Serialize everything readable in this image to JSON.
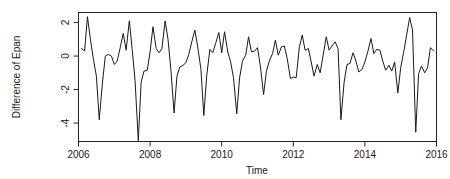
{
  "chart_data": {
    "type": "line",
    "title": "",
    "xlabel": "Time",
    "ylabel": "Difference of Epan",
    "xlim": [
      2006.0,
      2016.0
    ],
    "ylim": [
      -5.1,
      2.6
    ],
    "xticks": [
      2006,
      2008,
      2010,
      2012,
      2014,
      2016
    ],
    "xtick_labels": [
      "2006",
      "2008",
      "2010",
      "2012",
      "2014",
      "2016"
    ],
    "yticks": [
      2,
      0,
      -2,
      -4
    ],
    "ytick_labels": [
      "2",
      "0",
      "-2",
      "-4"
    ],
    "grid": false,
    "legend": null,
    "line_color": "#1a1a1a",
    "series": [
      {
        "name": "Difference of Epan",
        "x": [
          2006.08,
          2006.17,
          2006.25,
          2006.33,
          2006.42,
          2006.5,
          2006.58,
          2006.67,
          2006.75,
          2006.83,
          2006.92,
          2007.0,
          2007.08,
          2007.17,
          2007.25,
          2007.33,
          2007.42,
          2007.5,
          2007.58,
          2007.67,
          2007.75,
          2007.83,
          2007.92,
          2008.0,
          2008.08,
          2008.17,
          2008.25,
          2008.33,
          2008.42,
          2008.5,
          2008.58,
          2008.67,
          2008.75,
          2008.83,
          2008.92,
          2009.0,
          2009.08,
          2009.17,
          2009.25,
          2009.33,
          2009.42,
          2009.5,
          2009.58,
          2009.67,
          2009.75,
          2009.83,
          2009.92,
          2010.0,
          2010.08,
          2010.17,
          2010.25,
          2010.33,
          2010.42,
          2010.5,
          2010.58,
          2010.67,
          2010.75,
          2010.83,
          2010.92,
          2011.0,
          2011.08,
          2011.17,
          2011.25,
          2011.33,
          2011.42,
          2011.5,
          2011.58,
          2011.67,
          2011.75,
          2011.83,
          2011.92,
          2012.0,
          2012.08,
          2012.17,
          2012.25,
          2012.33,
          2012.42,
          2012.5,
          2012.58,
          2012.67,
          2012.75,
          2012.83,
          2012.92,
          2013.0,
          2013.08,
          2013.17,
          2013.25,
          2013.33,
          2013.42,
          2013.5,
          2013.58,
          2013.67,
          2013.75,
          2013.83,
          2013.92,
          2014.0,
          2014.08,
          2014.17,
          2014.25,
          2014.33,
          2014.42,
          2014.5,
          2014.58,
          2014.67,
          2014.75,
          2014.83,
          2014.92,
          2015.0,
          2015.08,
          2015.17,
          2015.25,
          2015.33,
          2015.42,
          2015.5,
          2015.58,
          2015.67,
          2015.75,
          2015.83,
          2015.92
        ],
        "values": [
          0.45,
          0.3,
          2.35,
          1.05,
          -0.25,
          -1.2,
          -3.8,
          -1.55,
          0.0,
          0.1,
          0.0,
          -0.5,
          -0.3,
          0.55,
          1.35,
          0.35,
          2.1,
          0.4,
          -1.45,
          -5.05,
          -1.55,
          -0.9,
          -0.85,
          0.25,
          1.75,
          0.45,
          0.2,
          0.45,
          2.1,
          1.0,
          -0.8,
          -3.4,
          -1.2,
          -0.65,
          -0.55,
          -0.4,
          0.1,
          0.9,
          1.55,
          0.55,
          -0.8,
          -3.55,
          -1.2,
          0.4,
          0.2,
          0.75,
          1.4,
          0.2,
          1.45,
          0.25,
          -0.35,
          -1.3,
          -3.45,
          -1.3,
          -0.3,
          0.05,
          1.15,
          0.25,
          0.3,
          0.5,
          -0.6,
          -2.3,
          -0.9,
          -0.3,
          0.15,
          0.95,
          0.05,
          0.55,
          0.6,
          -0.15,
          -1.35,
          -1.25,
          -1.3,
          0.55,
          1.25,
          0.35,
          0.45,
          -0.35,
          -1.2,
          -0.5,
          -1.0,
          0.0,
          1.15,
          0.35,
          0.6,
          0.85,
          0.45,
          -3.8,
          -1.55,
          -0.5,
          -0.45,
          0.2,
          -0.3,
          -0.95,
          -0.8,
          -0.35,
          0.25,
          1.05,
          0.15,
          0.4,
          0.35,
          -0.3,
          -0.85,
          -0.55,
          -0.9,
          -0.35,
          -2.2,
          -0.7,
          0.2,
          1.3,
          2.3,
          1.55,
          -4.55,
          -1.05,
          -0.6,
          -1.0,
          -0.7,
          0.5,
          0.3
        ]
      }
    ]
  },
  "axes": {
    "x_title": "Time",
    "y_title": "Difference of Epan"
  }
}
